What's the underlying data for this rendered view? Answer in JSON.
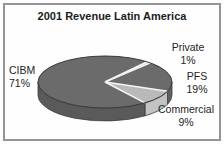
{
  "chart_data": {
    "type": "pie",
    "style": "3d",
    "title": "2001 Revenue Latin America",
    "legend": "none",
    "direction": "clockwise",
    "start_angle_deg": 39,
    "slices": [
      {
        "label": "Private",
        "value": 1,
        "pct": "1%",
        "top_color": "#dcdcdc",
        "side_color": "#d0d0d0"
      },
      {
        "label": "PFS",
        "value": 19,
        "pct": "19%",
        "top_color": "#6b6b6b",
        "side_color": "#616161"
      },
      {
        "label": "Commercial",
        "value": 9,
        "pct": "9%",
        "top_color": "#b9b9b9",
        "side_color": "#c3c3c3"
      },
      {
        "label": "CIBM",
        "value": 71,
        "pct": "71%",
        "top_color": "#6b6b6b",
        "side_color": "#5a5a5a"
      }
    ],
    "separator_color": "#f5f5f5",
    "outline_color": "#3a3a3a"
  }
}
